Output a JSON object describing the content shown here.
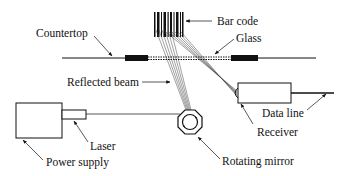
{
  "diagram": {
    "type": "bar code scanner schematic",
    "labels": {
      "bar_code": "Bar code",
      "glass": "Glass",
      "countertop": "Countertop",
      "reflected_beam": "Reflected beam",
      "data_line": "Data line",
      "receiver": "Receiver",
      "laser": "Laser",
      "power_supply": "Power supply",
      "rotating_mirror": "Rotating mirror"
    },
    "colors": {
      "line": "#111111",
      "background": "#ffffff"
    }
  }
}
